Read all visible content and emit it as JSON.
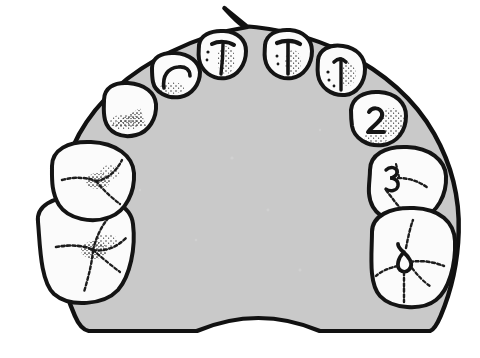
{
  "figure": {
    "title": "Occlusal view of maxillary dental arch",
    "view": "occlusal",
    "arch": "maxillary",
    "tooth_count": 10,
    "medium": "ink line drawing, halftone scan"
  },
  "colors": {
    "background": "#ffffff",
    "palate_fill": "#c9c9c9",
    "palate_fill_shadow": "#c0c0c0",
    "outline": "#111111",
    "tooth_fill": "#fbfbfb",
    "tooth_outline": "#141414",
    "stipple": "#1a1a1a"
  },
  "palate": {
    "label": "palate-body",
    "apex_notch_label": "incisive-papilla-notch",
    "posterior_notch_label": "posterior-border-notch"
  },
  "teeth": [
    {
      "id": "upper-left-second-molar",
      "position_label": "left-posterior-1",
      "marking": "",
      "surface_pattern": "cross-fissure",
      "stippled": true
    },
    {
      "id": "upper-left-first-molar",
      "position_label": "left-posterior-2",
      "marking": "",
      "surface_pattern": "cross-fissure",
      "stippled": true
    },
    {
      "id": "upper-left-canine",
      "position_label": "left-anterior-3",
      "marking": "",
      "surface_pattern": "stipple-band",
      "stippled": true
    },
    {
      "id": "upper-left-lateral-incisor",
      "position_label": "left-anterior-4",
      "marking": "",
      "surface_pattern": "cingulum-ridge",
      "stippled": true
    },
    {
      "id": "upper-left-central-incisor",
      "position_label": "left-anterior-5",
      "marking": "",
      "surface_pattern": "cingulum-ridge",
      "stippled": true
    },
    {
      "id": "upper-right-central-incisor",
      "position_label": "right-anterior-1",
      "marking": "",
      "surface_pattern": "cingulum-ridge",
      "stippled": true
    },
    {
      "id": "upper-right-lateral-incisor",
      "position_label": "right-anterior-2",
      "marking": "1",
      "surface_pattern": "cingulum-ridge",
      "stippled": true
    },
    {
      "id": "upper-right-canine",
      "position_label": "right-anterior-3",
      "marking": "2",
      "surface_pattern": "stipple-field",
      "stippled": true
    },
    {
      "id": "upper-right-first-molar",
      "position_label": "right-posterior-1",
      "marking": "3",
      "surface_pattern": "cross-fissure",
      "stippled": false
    },
    {
      "id": "upper-right-second-molar",
      "position_label": "right-posterior-2",
      "marking": "4",
      "surface_pattern": "cross-fissure",
      "stippled": false
    }
  ],
  "markings_visible": [
    "1",
    "2",
    "3",
    "4"
  ]
}
